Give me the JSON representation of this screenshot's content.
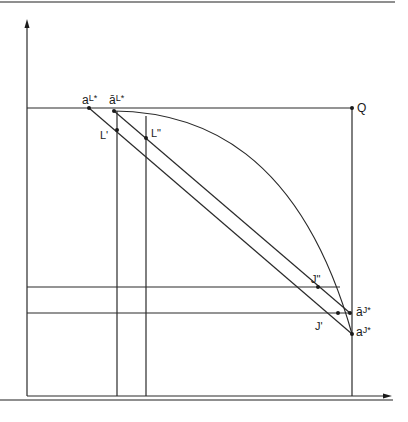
{
  "diagram": {
    "type": "economics-box-diagram",
    "labels": {
      "a_L_star": "a",
      "a_L_star_sup": "L*",
      "abar_L_star": "ā",
      "abar_L_star_sup": "L*",
      "L_prime": "L'",
      "L_double_prime": "L\"",
      "Q": "Q",
      "J_double_prime": "J\"",
      "J_prime": "J'",
      "abar_J_star": "ā",
      "abar_J_star_sup": "J*",
      "a_J_star": "a",
      "a_J_star_sup": "J*"
    },
    "colors": {
      "line": "#2a2a2a",
      "rule": "#6a6a6a",
      "background": "#ffffff"
    },
    "points": {
      "a_L_star": [
        89,
        108
      ],
      "abar_L_star": [
        114,
        111
      ],
      "L_prime": [
        117,
        130
      ],
      "L_double_prime": [
        146,
        138
      ],
      "Q": [
        352,
        108
      ],
      "J_double_prime": [
        318,
        287
      ],
      "J_prime": [
        338,
        313
      ],
      "abar_J_star": [
        350,
        313
      ],
      "a_J_star": [
        352,
        334
      ]
    }
  }
}
